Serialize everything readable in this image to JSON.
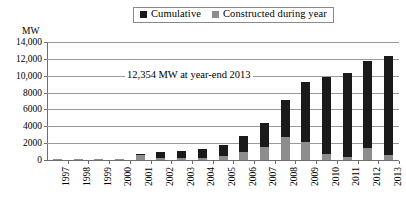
{
  "legend": {
    "entries": [
      {
        "label": "Cumulative",
        "color": "#1a1a1a",
        "icon": "square-marker-icon"
      },
      {
        "label": "Constructed during year",
        "color": "#8d8d8d",
        "icon": "square-marker-icon"
      }
    ]
  },
  "axis": {
    "y_unit": "MW",
    "y_ticks": [
      "14,000",
      "12,000",
      "10,000",
      "8000",
      "6000",
      "4000",
      "2000",
      "0"
    ]
  },
  "annotation": {
    "text": "12,354 MW at year-end 2013"
  },
  "chart_data": {
    "type": "bar",
    "title": "",
    "subtitle": "",
    "xlabel": "",
    "ylabel": "MW",
    "ylim": [
      0,
      14000
    ],
    "ytick_values": [
      14000,
      12000,
      10000,
      8000,
      6000,
      4000,
      2000,
      0
    ],
    "grid": true,
    "legend_position": "top-center",
    "bar_mode": "overlaid",
    "annotations": [
      "12,354 MW at year-end 2013"
    ],
    "categories": [
      "1997",
      "1998",
      "1999",
      "2000",
      "2001",
      "2002",
      "2003",
      "2004",
      "2005",
      "2006",
      "2007",
      "2008",
      "2009",
      "2010",
      "2011",
      "2012",
      "2013"
    ],
    "series": [
      {
        "name": "Cumulative",
        "color": "#1a1a1a",
        "values": [
          60,
          90,
          120,
          160,
          700,
          900,
          1100,
          1300,
          1800,
          2800,
          4400,
          7100,
          9200,
          9900,
          10300,
          11700,
          12354
        ]
      },
      {
        "name": "Constructed during year",
        "color": "#8d8d8d",
        "values": [
          10,
          30,
          30,
          40,
          540,
          200,
          200,
          200,
          500,
          1000,
          1600,
          2700,
          2100,
          700,
          400,
          1400,
          654
        ]
      }
    ]
  }
}
